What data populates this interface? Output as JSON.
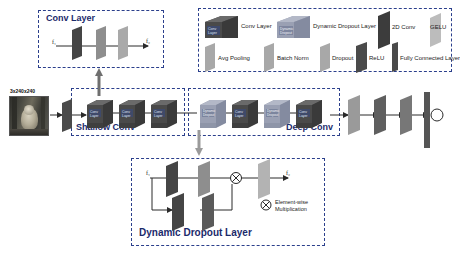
{
  "figure": {
    "title_hidden": "Network architecture diagram"
  },
  "conv_layer_box": {
    "title": "Conv Layer",
    "input_label": "f₁",
    "output_label": "f₂",
    "slab_count": 3
  },
  "legend": {
    "items": [
      {
        "label": "Conv Layer",
        "icon": "cube-icon",
        "inner_text": "Conv Layer",
        "color": "#4a4a4a"
      },
      {
        "label": "Dynamic Dropout Layer",
        "icon": "cube-icon",
        "inner_text": "Dynamic Dropout",
        "color": "#8c93a8"
      },
      {
        "label": "2D Conv",
        "icon": "slab-icon",
        "color": "#3c3c3c"
      },
      {
        "label": "GELU",
        "icon": "slab-icon",
        "color": "#b9b9b9"
      },
      {
        "label": "Avg Pooling",
        "icon": "slab-icon",
        "color": "#a8a8a8"
      },
      {
        "label": "Batch Norm",
        "icon": "slab-icon",
        "color": "#a8a8a8"
      },
      {
        "label": "Dropout",
        "icon": "slab-icon",
        "color": "#a8a8a8"
      },
      {
        "label": "ReLU",
        "icon": "slab-icon",
        "color": "#4a4a4a"
      },
      {
        "label": "Fully Connected Layer",
        "icon": "bar-icon",
        "color": "#4a4a4a"
      }
    ]
  },
  "pipeline": {
    "input_image_caption": "3x240x240",
    "shallow_conv": {
      "title": "Shallow Conv",
      "blocks": [
        {
          "label": "Conv Layer",
          "type": "conv"
        },
        {
          "label": "Conv Layer",
          "type": "conv"
        },
        {
          "label": "Conv Layer",
          "type": "conv"
        }
      ]
    },
    "deep_conv": {
      "title": "Deep Conv",
      "blocks": [
        {
          "label": "Dynamic Dropout",
          "type": "dropout"
        },
        {
          "label": "Conv Layer",
          "type": "conv"
        },
        {
          "label": "Dynamic Dropout",
          "type": "dropout"
        },
        {
          "label": "Conv Layer",
          "type": "conv"
        }
      ]
    },
    "tail": {
      "slabs": [
        {
          "name": "slab-1",
          "color": "#9a9a9a"
        },
        {
          "name": "slab-2",
          "color": "#5f5f5f"
        },
        {
          "name": "slab-3",
          "color": "#777777"
        }
      ],
      "fc_bar": {
        "label": "Fully Connected Layer",
        "color": "#555555"
      },
      "output_node": {
        "label": "output"
      }
    }
  },
  "dynamic_dropout_box": {
    "title": "Dynamic Dropout Layer",
    "input_label": "f₁",
    "output_label": "f₂",
    "legend_note": "Element-wise\nMultiplication",
    "legend_note_line1": "Element-wise",
    "legend_note_line2": "Multiplication",
    "operator_symbol": "⊗",
    "top_branch": [
      {
        "name": "top-slab-1",
        "color": "#454545"
      },
      {
        "name": "top-slab-2",
        "color": "#8e8e8e"
      }
    ],
    "bottom_branch": [
      {
        "name": "bottom-slab-1",
        "color": "#454545"
      },
      {
        "name": "bottom-slab-2",
        "color": "#5a5a5a"
      }
    ],
    "output_slab": {
      "name": "output-slab",
      "color": "#b3b3b3"
    }
  },
  "colors": {
    "dash_border": "#2b3f8c",
    "title_text": "#1b2a6b",
    "conv_cube": "#4a4a4a",
    "dropout_cube": "#8c93a8",
    "line": "#2a2a2a"
  }
}
